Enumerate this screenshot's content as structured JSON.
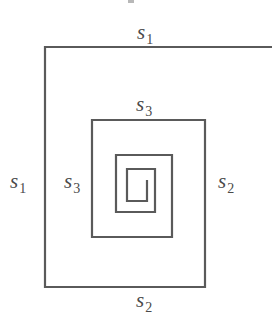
{
  "figure": {
    "width": 275,
    "height": 333,
    "line_color": "#5a5a5a",
    "line_width": 2.2,
    "text_color": "#4a4a4a",
    "spiral_points": "272,47 45,47 45,287 205,287 205,120 92,120 92,237 172,237 172,155 116,155 116,212 155,212 155,169 127,169 127,201 147,201 147,180"
  },
  "labels": {
    "top": {
      "base": "s",
      "sub": "1"
    },
    "left_outer": {
      "base": "s",
      "sub": "1"
    },
    "inner_top": {
      "base": "s",
      "sub": "3"
    },
    "inner_left": {
      "base": "s",
      "sub": "3"
    },
    "right": {
      "base": "s",
      "sub": "2"
    },
    "bottom": {
      "base": "s",
      "sub": "2"
    }
  }
}
